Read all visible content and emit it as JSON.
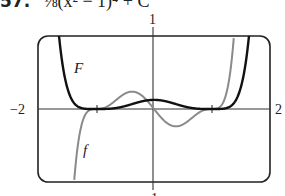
{
  "header": {
    "problem_number": "57.",
    "expression": "⅛(x² − 1)⁴ + C"
  },
  "chart_data": {
    "type": "line",
    "title": "",
    "xlabel": "",
    "ylabel": "",
    "xlim": [
      -2,
      2
    ],
    "ylim": [
      -1,
      1
    ],
    "grid": false,
    "tick_labels": {
      "x_left": "−2",
      "x_right": "2",
      "y_top": "1",
      "y_bottom": "−1"
    },
    "x_ticks_marked": [
      -1,
      1
    ],
    "series": [
      {
        "name": "F",
        "formula": "F(x) = (1/8)(x^2 - 1)^4",
        "color": "#111111",
        "style": "thick",
        "x": [
          -1.45,
          -1.3,
          -1.2,
          -1.1,
          -1.0,
          -0.8,
          -0.6,
          -0.4,
          -0.2,
          0.0,
          0.2,
          0.4,
          0.6,
          0.8,
          1.0,
          1.1,
          1.2,
          1.3,
          1.45
        ],
        "values": [
          1.0,
          0.45,
          0.14,
          0.02,
          0.0,
          0.02,
          0.05,
          0.08,
          0.11,
          0.125,
          0.11,
          0.08,
          0.05,
          0.02,
          0.0,
          0.02,
          0.14,
          0.45,
          1.0
        ]
      },
      {
        "name": "f",
        "formula": "f(x) = x(x^2 - 1)^3",
        "color": "#8a8a8a",
        "style": "thin",
        "x": [
          -1.35,
          -1.2,
          -1.1,
          -1.0,
          -0.8,
          -0.6,
          -0.45,
          -0.3,
          -0.15,
          0.0,
          0.15,
          0.3,
          0.45,
          0.6,
          0.8,
          1.0,
          1.1,
          1.2,
          1.35
        ],
        "values": [
          -1.0,
          -0.35,
          -0.01,
          0.0,
          0.04,
          0.16,
          0.23,
          0.21,
          0.13,
          0.0,
          -0.13,
          -0.21,
          -0.23,
          -0.16,
          -0.04,
          0.0,
          0.01,
          0.35,
          1.0
        ]
      }
    ],
    "annotations": [
      {
        "text": "F",
        "near": "upper-left branch of F"
      },
      {
        "text": "f",
        "near": "lower-left branch of f"
      }
    ]
  }
}
